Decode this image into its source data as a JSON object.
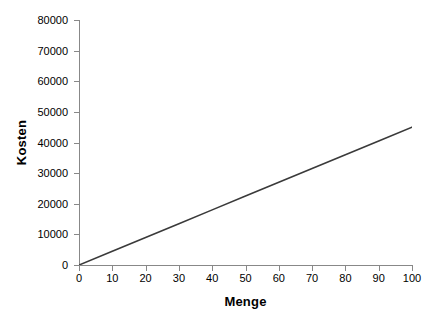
{
  "chart_data": {
    "type": "line",
    "title": "",
    "subtitle": "",
    "xlabel": "Menge",
    "ylabel": "Kosten",
    "xlim": [
      0,
      100
    ],
    "ylim": [
      0,
      80000
    ],
    "grid": false,
    "legend": false,
    "legend_position": "none",
    "x_ticks": [
      0,
      10,
      20,
      30,
      40,
      50,
      60,
      70,
      80,
      90,
      100
    ],
    "y_ticks": [
      0,
      10000,
      20000,
      30000,
      40000,
      50000,
      60000,
      70000,
      80000
    ],
    "x_tick_labels": [
      "0",
      "10",
      "20",
      "30",
      "40",
      "50",
      "60",
      "70",
      "80",
      "90",
      "100"
    ],
    "y_tick_labels": [
      "0",
      "10000",
      "20000",
      "30000",
      "40000",
      "50000",
      "60000",
      "70000",
      "80000"
    ],
    "series": [
      {
        "name": "Kosten",
        "color": "#3a3a3a",
        "line_width": 1.6,
        "x": [
          0,
          10,
          20,
          30,
          40,
          50,
          60,
          70,
          80,
          90,
          100
        ],
        "values": [
          0,
          4500,
          9000,
          13500,
          18000,
          22500,
          27000,
          31500,
          36000,
          40500,
          45000
        ]
      }
    ],
    "annotations": []
  },
  "figure": {
    "background_color": "#ffffff",
    "axis_color": "#888888",
    "text_color": "#000000",
    "width": 442,
    "height": 323
  }
}
